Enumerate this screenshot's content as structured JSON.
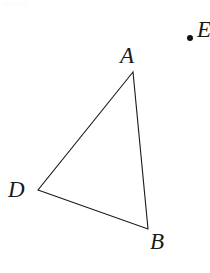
{
  "figure": {
    "type": "geometry-diagram",
    "background_color": "#ffffff",
    "stroke_color": "#1a1a1a",
    "stroke_width": 1.1,
    "canvas": {
      "width": 210,
      "height": 273
    },
    "vertices": [
      {
        "id": "A",
        "label": "A",
        "x": 133,
        "y": 72
      },
      {
        "id": "D",
        "label": "D",
        "x": 38,
        "y": 190
      },
      {
        "id": "B",
        "label": "B",
        "x": 148,
        "y": 229
      }
    ],
    "edges": [
      {
        "id": "AD",
        "from": "A",
        "to": "D"
      },
      {
        "id": "DB",
        "from": "D",
        "to": "B"
      },
      {
        "id": "BA",
        "from": "B",
        "to": "A"
      }
    ],
    "polygon_points": "133,72 38,190 148,229",
    "marker_point": {
      "label": "E",
      "x": 190,
      "y": 38,
      "radius": 3,
      "color": "#111111",
      "label_clipped": true
    },
    "labels": {
      "A": "A",
      "D": "D",
      "B": "B",
      "marker": "E"
    }
  }
}
